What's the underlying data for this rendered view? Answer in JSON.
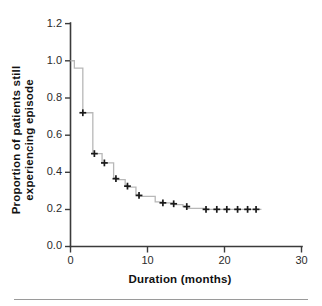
{
  "figure": {
    "background_color": "#ffffff",
    "axis_color": "#3b3b3b",
    "step_color": "#b8b8b8",
    "marker_color": "#1a1a1a"
  },
  "labels": {
    "x_axis_title": "Duration (months)",
    "y_axis_title_line1": "Proportion of patients still",
    "y_axis_title_line2": "experiencing episode"
  },
  "ticks": {
    "y": [
      "0.0",
      "0.2",
      "0.4",
      "0.6",
      "0.8",
      "1.0",
      "1.2"
    ],
    "x": [
      "0",
      "10",
      "20",
      "30"
    ]
  },
  "chart_data": {
    "type": "line",
    "title": "",
    "subtitle": "",
    "xlabel": "Duration (months)",
    "ylabel": "Proportion of patients still experiencing episode",
    "xlim": [
      0,
      30
    ],
    "ylim": [
      0.0,
      1.2
    ],
    "xticks": [
      0,
      10,
      20,
      30
    ],
    "yticks": [
      0.0,
      0.2,
      0.4,
      0.6,
      0.8,
      1.0,
      1.2
    ],
    "grid": false,
    "legend": null,
    "series": [
      {
        "name": "Kaplan-Meier survival estimate",
        "style": "step-post",
        "x": [
          0.0,
          0.5,
          0.5,
          1.6,
          1.6,
          2.9,
          2.9,
          3.1,
          3.1,
          4.1,
          4.1,
          4.4,
          4.4,
          5.6,
          5.6,
          5.9,
          5.9,
          7.1,
          7.1,
          7.4,
          7.4,
          8.5,
          8.5,
          8.9,
          8.9,
          11.0,
          11.0,
          12.0,
          12.0,
          13.4,
          13.4,
          14.6,
          14.6,
          15.1,
          15.1,
          17.6,
          17.6,
          24.8
        ],
        "y": [
          1.0,
          1.0,
          0.96,
          0.96,
          0.72,
          0.72,
          0.5,
          0.5,
          0.5,
          0.5,
          0.45,
          0.45,
          0.45,
          0.45,
          0.37,
          0.37,
          0.36,
          0.36,
          0.33,
          0.33,
          0.32,
          0.32,
          0.28,
          0.28,
          0.27,
          0.27,
          0.24,
          0.24,
          0.235,
          0.235,
          0.225,
          0.225,
          0.215,
          0.215,
          0.205,
          0.205,
          0.2,
          0.2
        ]
      }
    ],
    "censored_points": [
      {
        "x": 1.6,
        "y": 0.72
      },
      {
        "x": 3.1,
        "y": 0.5
      },
      {
        "x": 4.4,
        "y": 0.45
      },
      {
        "x": 5.9,
        "y": 0.365
      },
      {
        "x": 7.4,
        "y": 0.325
      },
      {
        "x": 8.9,
        "y": 0.275
      },
      {
        "x": 12.0,
        "y": 0.235
      },
      {
        "x": 13.4,
        "y": 0.23
      },
      {
        "x": 15.1,
        "y": 0.215
      },
      {
        "x": 17.6,
        "y": 0.2
      },
      {
        "x": 19.0,
        "y": 0.2
      },
      {
        "x": 20.3,
        "y": 0.2
      },
      {
        "x": 21.7,
        "y": 0.2
      },
      {
        "x": 23.0,
        "y": 0.2
      },
      {
        "x": 24.1,
        "y": 0.2
      }
    ]
  }
}
